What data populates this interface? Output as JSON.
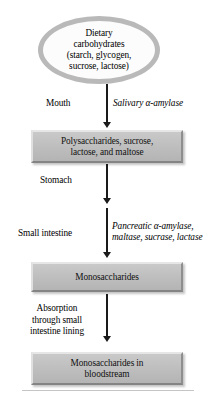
{
  "diagram": {
    "start_node": {
      "shape": "ellipse",
      "lines": [
        "Dietary",
        "carbohydrates",
        "(starch, glycogen,",
        "sucrose, lactose)"
      ]
    },
    "steps": [
      {
        "id": "polysaccharides",
        "shape": "box",
        "lines": [
          "Polysaccharides, sucrose,",
          "lactose, and maltose"
        ]
      },
      {
        "id": "monosaccharides",
        "shape": "box",
        "lines": [
          "Monosaccharides"
        ]
      },
      {
        "id": "monosaccharides-blood",
        "shape": "box",
        "lines": [
          "Monosaccharides in",
          "bloodstream"
        ]
      }
    ],
    "edge_labels": {
      "mouth": "Mouth",
      "salivary_enzyme": "Salivary α-amylase",
      "stomach": "Stomach",
      "small_intestine": "Small intestine",
      "pancreatic_enzymes_line1": "Pancreatic α-amylase,",
      "pancreatic_enzymes_line2": "maltase, sucrase, lactase",
      "absorption_line1": "Absorption",
      "absorption_line2": "through small",
      "absorption_line3": "intestine lining"
    },
    "colors": {
      "box_fill": "#bdbdbd",
      "box_highlight": "#e6e6e6",
      "box_shadow": "#848484",
      "ellipse_border": "#b9b9b9",
      "ellipse_fill": "#fcfcfc",
      "arrow": "#1a1a1a",
      "background": "#ffffff",
      "rule": "#c5c5c5"
    }
  }
}
